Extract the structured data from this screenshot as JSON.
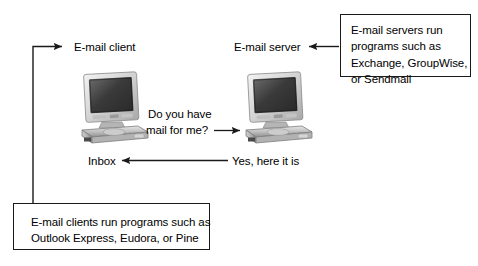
{
  "diagram": {
    "background_color": "#ffffff",
    "line_color": "#1a1a1a",
    "text_color": "#000000"
  },
  "labels": {
    "client": "E-mail client",
    "server": "E-mail server",
    "inbox": "Inbox",
    "request_line1": "Do you have",
    "request_line2": "mail for me?",
    "response": "Yes, here it is"
  },
  "callouts": {
    "server_note": {
      "line1": "E-mail servers run",
      "line2": "programs such as",
      "line3": "Exchange, GroupWise,",
      "line4": "or Sendmail"
    },
    "client_note": {
      "line1": "E-mail clients run programs such as",
      "line2": "Outlook Express, Eudora, or Pine"
    }
  },
  "nodes": {
    "client_computer": "client-computer-illustration",
    "server_computer": "server-computer-illustration"
  },
  "arrows": {
    "client_callout_pointer": "arrow-right-to-client-label",
    "server_callout_pointer": "arrow-left-to-server-label",
    "request_arrow": "arrow-right-client-to-server",
    "response_arrow": "arrow-left-server-to-inbox"
  }
}
